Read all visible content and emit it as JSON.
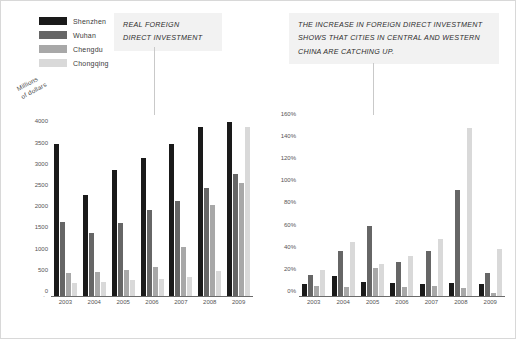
{
  "legend": {
    "items": [
      {
        "label": "Shenzhen",
        "color": "#1a1a1a"
      },
      {
        "label": "Wuhan",
        "color": "#666666"
      },
      {
        "label": "Chengdu",
        "color": "#a8a8a8"
      },
      {
        "label": "Chongqing",
        "color": "#d9d9d9"
      }
    ]
  },
  "callouts": {
    "left": {
      "lines": [
        "REAL FOREIGN",
        "DIRECT INVESTMENT"
      ]
    },
    "right": {
      "lines": [
        "THE INCREASE IN FOREIGN DIRECT INVESTMENT",
        "SHOWS THAT CITIES IN CENTRAL AND WESTERN",
        "CHINA ARE CATCHING UP."
      ]
    }
  },
  "chart_data": [
    {
      "type": "bar",
      "id": "real-fdi",
      "title": "REAL FOREIGN DIRECT INVESTMENT",
      "xlabel": "",
      "ylabel": "Millions of dollars",
      "ylabel_lines": [
        "Millions",
        "of dollars"
      ],
      "categories": [
        "2003",
        "2004",
        "2005",
        "2006",
        "2007",
        "2008",
        "2009"
      ],
      "yticks": [
        0,
        500,
        1000,
        1500,
        2000,
        2500,
        3000,
        3500,
        4000
      ],
      "ytick_labels": [
        "0",
        "500",
        "1000",
        "1500",
        "2000",
        "2500",
        "3000",
        "3500",
        "4000"
      ],
      "ylim": [
        0,
        4200
      ],
      "grid": false,
      "legend_position": "top-left",
      "series": [
        {
          "name": "Shenzhen",
          "color": "#1a1a1a",
          "values": [
            3620,
            2400,
            3000,
            3280,
            3610,
            4000,
            4120
          ]
        },
        {
          "name": "Wuhan",
          "color": "#666666",
          "values": [
            1780,
            1520,
            1750,
            2050,
            2270,
            2580,
            2900
          ]
        },
        {
          "name": "Chengdu",
          "color": "#a8a8a8",
          "values": [
            560,
            580,
            640,
            700,
            1180,
            2180,
            2680
          ]
        },
        {
          "name": "Chongqing",
          "color": "#d9d9d9",
          "values": [
            320,
            360,
            400,
            420,
            470,
            620,
            4000
          ]
        }
      ]
    },
    {
      "type": "bar",
      "id": "fdi-growth",
      "title": "THE INCREASE IN FOREIGN DIRECT INVESTMENT",
      "xlabel": "",
      "ylabel": "",
      "categories": [
        "2003",
        "2004",
        "2005",
        "2006",
        "2007",
        "2008",
        "2009"
      ],
      "yticks": [
        0,
        20,
        40,
        60,
        80,
        100,
        120,
        140,
        160
      ],
      "ytick_labels": [
        "0%",
        "20%",
        "40%",
        "60%",
        "80%",
        "100%",
        "120%",
        "140%",
        "160%"
      ],
      "ylim": [
        0,
        168
      ],
      "grid": false,
      "series": [
        {
          "name": "Shenzhen",
          "color": "#1a1a1a",
          "values": [
            12,
            19,
            14,
            13,
            12,
            13,
            12
          ]
        },
        {
          "name": "Wuhan",
          "color": "#666666",
          "values": [
            20,
            42,
            64,
            32,
            42,
            97,
            22
          ]
        },
        {
          "name": "Chengdu",
          "color": "#a8a8a8",
          "values": [
            10,
            9,
            26,
            9,
            10,
            8,
            4
          ]
        },
        {
          "name": "Chongqing",
          "color": "#d9d9d9",
          "values": [
            24,
            50,
            30,
            37,
            52,
            153,
            43
          ]
        }
      ]
    }
  ]
}
